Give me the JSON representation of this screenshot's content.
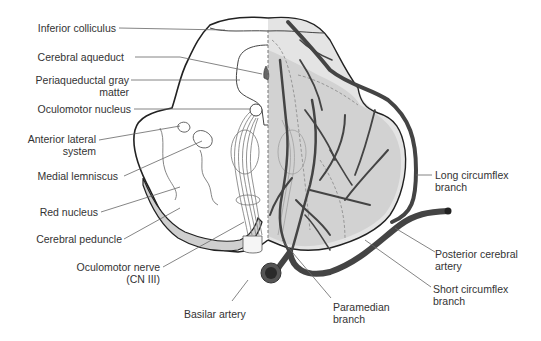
{
  "figure": {
    "colors": {
      "outline": "#222222",
      "artery": "#555555",
      "artery_dark": "#3a3a3a",
      "shade_light": "#e2e2e2",
      "shade_mid": "#cfcfcf",
      "leader": "#666666",
      "text": "#333333"
    }
  },
  "labels_left": {
    "inferior_colliculus": "Inferior colliculus",
    "cerebral_aqueduct": "Cerebral aqueduct",
    "periaqueductal_1": "Periaqueductal gray",
    "periaqueductal_2": "matter",
    "oculomotor_nucleus": "Oculomotor nucleus",
    "anterior_lateral_1": "Anterior lateral",
    "anterior_lateral_2": "system",
    "medial_lemniscus": "Medial lemniscus",
    "red_nucleus": "Red nucleus",
    "cerebral_peduncle": "Cerebral peduncle",
    "oculomotor_nerve_1": "Oculomotor nerve",
    "oculomotor_nerve_2": "(CN III)",
    "basilar_artery": "Basilar artery"
  },
  "labels_right": {
    "long_circumflex_1": "Long circumflex",
    "long_circumflex_2": "branch",
    "posterior_cerebral_1": "Posterior cerebral",
    "posterior_cerebral_2": "artery",
    "short_circumflex_1": "Short circumflex",
    "short_circumflex_2": "branch",
    "paramedian_1": "Paramedian",
    "paramedian_2": "branch"
  }
}
